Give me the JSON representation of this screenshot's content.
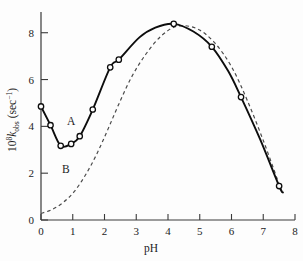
{
  "chart_data": {
    "type": "line",
    "title": "",
    "xlabel": "pH",
    "ylabel": "10^8 k_obs (sec^-1)",
    "ylabel_parts": {
      "base": "10",
      "exponent": "8",
      "symbol": "k",
      "subscript": "obs",
      "units": "(sec",
      "units_exponent": "−1",
      "units_close": ")"
    },
    "xlim": [
      0,
      8
    ],
    "ylim": [
      0,
      8.8
    ],
    "xticks": [
      0,
      1,
      2,
      3,
      4,
      5,
      6,
      7,
      8
    ],
    "xtick_labels": [
      "0",
      "1",
      "2",
      "3",
      "4",
      "5",
      "6",
      "7",
      "8"
    ],
    "yticks": [
      0,
      2,
      4,
      6,
      8
    ],
    "ytick_labels": [
      "0",
      "2",
      "4",
      "6",
      "8"
    ],
    "grid": false,
    "legend_position": "inline-annotations",
    "annotations": [
      {
        "text": "A",
        "x": 0.95,
        "y": 4.05,
        "name": "curve-a-label"
      },
      {
        "text": "B",
        "x": 0.78,
        "y": 2.02,
        "name": "curve-b-label"
      }
    ],
    "series": [
      {
        "name": "A",
        "style": "solid",
        "marker": "open-circle",
        "points": [
          {
            "x": 0.0,
            "y": 4.85
          },
          {
            "x": 0.3,
            "y": 4.05
          },
          {
            "x": 0.62,
            "y": 3.17
          },
          {
            "x": 0.95,
            "y": 3.25
          },
          {
            "x": 1.22,
            "y": 3.58
          },
          {
            "x": 1.63,
            "y": 4.72
          },
          {
            "x": 2.18,
            "y": 6.52
          },
          {
            "x": 2.45,
            "y": 6.85
          },
          {
            "x": 4.18,
            "y": 8.38
          },
          {
            "x": 5.38,
            "y": 7.4
          },
          {
            "x": 6.3,
            "y": 5.25
          },
          {
            "x": 7.5,
            "y": 1.45
          }
        ],
        "curve": [
          {
            "x": 0.0,
            "y": 4.85
          },
          {
            "x": 0.3,
            "y": 4.05
          },
          {
            "x": 0.62,
            "y": 3.17
          },
          {
            "x": 0.95,
            "y": 3.25
          },
          {
            "x": 1.22,
            "y": 3.58
          },
          {
            "x": 1.63,
            "y": 4.72
          },
          {
            "x": 2.18,
            "y": 6.52
          },
          {
            "x": 2.45,
            "y": 6.85
          },
          {
            "x": 3.1,
            "y": 7.8
          },
          {
            "x": 3.6,
            "y": 8.22
          },
          {
            "x": 4.18,
            "y": 8.38
          },
          {
            "x": 4.8,
            "y": 8.05
          },
          {
            "x": 5.38,
            "y": 7.4
          },
          {
            "x": 5.9,
            "y": 6.35
          },
          {
            "x": 6.3,
            "y": 5.25
          },
          {
            "x": 6.9,
            "y": 3.45
          },
          {
            "x": 7.5,
            "y": 1.45
          },
          {
            "x": 7.62,
            "y": 1.18
          }
        ]
      },
      {
        "name": "B",
        "style": "dashed",
        "marker": "none",
        "curve": [
          {
            "x": 0.0,
            "y": 0.28
          },
          {
            "x": 0.35,
            "y": 0.45
          },
          {
            "x": 0.7,
            "y": 0.75
          },
          {
            "x": 1.05,
            "y": 1.22
          },
          {
            "x": 1.4,
            "y": 1.92
          },
          {
            "x": 1.75,
            "y": 2.8
          },
          {
            "x": 2.1,
            "y": 3.85
          },
          {
            "x": 2.45,
            "y": 4.95
          },
          {
            "x": 2.85,
            "y": 6.1
          },
          {
            "x": 3.3,
            "y": 7.08
          },
          {
            "x": 3.8,
            "y": 7.88
          },
          {
            "x": 4.3,
            "y": 8.28
          },
          {
            "x": 4.9,
            "y": 8.18
          },
          {
            "x": 5.45,
            "y": 7.6
          },
          {
            "x": 6.0,
            "y": 6.55
          },
          {
            "x": 6.5,
            "y": 5.1
          },
          {
            "x": 7.0,
            "y": 3.4
          },
          {
            "x": 7.45,
            "y": 1.72
          },
          {
            "x": 7.62,
            "y": 1.1
          }
        ]
      }
    ]
  },
  "figure": {
    "background_color": "#fdfdfd",
    "axis_color": "#3a3a3a",
    "curve_a_color": "#0d0d0d",
    "curve_b_color": "#4a4a4a"
  }
}
